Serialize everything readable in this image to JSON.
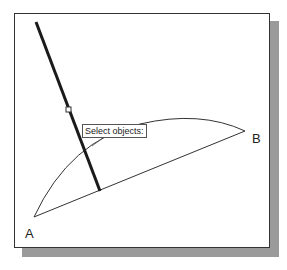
{
  "canvas": {
    "background": "#ffffff",
    "frame_border_color": "#333333",
    "shadow_color": "#9a9a9a"
  },
  "drawing": {
    "points": {
      "A": {
        "label": "A"
      },
      "B": {
        "label": "B"
      }
    },
    "objects": [
      {
        "type": "line",
        "name": "chord-AB",
        "selected": false
      },
      {
        "type": "arc",
        "name": "arc-AB",
        "selected": false
      },
      {
        "type": "line",
        "name": "highlighted-line",
        "selected": true
      }
    ]
  },
  "tooltip": {
    "text": "Select objects:"
  },
  "cursor": {
    "icon": "pickbox-cursor-icon"
  }
}
